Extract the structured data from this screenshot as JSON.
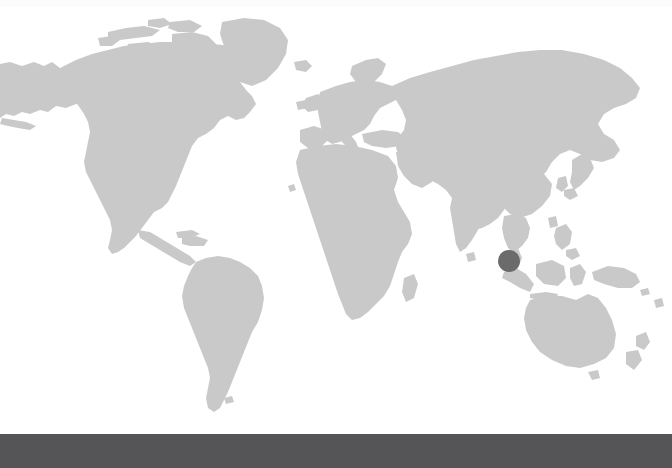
{
  "page": {
    "background_color": "#ffffff",
    "width": 672,
    "height": 468
  },
  "top_band": {
    "name": "top-faint-band",
    "color": "#fcfcfd",
    "height_px": 7
  },
  "map": {
    "name": "world-map",
    "projection": "equirectangular",
    "land_color": "#c9c9c9",
    "ocean_color": "#ffffff",
    "width_px": 672,
    "height_px": 434,
    "regions_visible": [
      "North America",
      "Greenland",
      "Canadian Arctic Archipelago",
      "Alaska",
      "Central America",
      "Caribbean",
      "South America",
      "Iceland",
      "Europe",
      "Scandinavia",
      "British Isles",
      "Mediterranean",
      "Africa",
      "Madagascar",
      "Arabian Peninsula",
      "Russia",
      "Siberia",
      "Central Asia",
      "India",
      "Sri Lanka",
      "China",
      "Korea",
      "Japan",
      "Taiwan",
      "Southeast Asia",
      "Philippines",
      "Indonesia",
      "Borneo",
      "New Guinea",
      "Australia",
      "New Zealand"
    ]
  },
  "marker": {
    "name": "location-marker-dot",
    "color": "#6b6b6b",
    "shape": "circle",
    "center_x": 509,
    "center_y": 261,
    "radius": 11,
    "region_label": "Malay Peninsula / Singapore"
  },
  "bottom_bar": {
    "name": "bottom-bar",
    "color": "#555558",
    "height_px": 34,
    "label": ""
  }
}
